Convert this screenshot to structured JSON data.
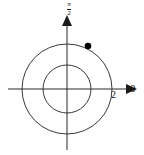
{
  "figure": {
    "background_color": "#ffffff",
    "stroke_color": "#2b2b2b",
    "point_color": "#000000",
    "width": 144,
    "height": 155
  },
  "labels": {
    "polar_axis": "0",
    "vertical_axis_numerator": "π",
    "vertical_axis_denominator": "2",
    "radial_tick": "2"
  },
  "chart_data": {
    "type": "scatter",
    "coordinate_system": "polar",
    "title": "",
    "xlabel": "",
    "ylabel": "",
    "grid": true,
    "legend": null,
    "center_px": [
      67,
      89
    ],
    "axes": [
      {
        "name": "polar-axis",
        "direction": "right",
        "angle_label": "0",
        "arrow": true,
        "from_px": [
          8,
          89
        ],
        "to_px": [
          136,
          89
        ]
      },
      {
        "name": "pi-over-two-axis",
        "direction": "up",
        "angle_label": "π/2",
        "arrow": true,
        "from_px": [
          67,
          150
        ],
        "to_px": [
          67,
          20
        ]
      }
    ],
    "grid_circles": [
      {
        "r_units": 1,
        "r_px": 24,
        "labeled": false
      },
      {
        "r_units": 2,
        "r_px": 45,
        "labeled": true,
        "tick_label": "2"
      }
    ],
    "tick_labels": [
      {
        "axis": "polar-axis",
        "value": 2,
        "text": "2",
        "px": [
          112,
          89
        ]
      }
    ],
    "points": [
      {
        "label": "",
        "r": 2,
        "theta_deg": 64,
        "x": 0.88,
        "y": 1.8,
        "px": [
          88,
          46
        ],
        "marker": "filled-circle",
        "color": "#000000"
      }
    ],
    "axis_ranges": {
      "r": [
        0,
        2
      ],
      "theta_deg": [
        0,
        360
      ]
    }
  }
}
